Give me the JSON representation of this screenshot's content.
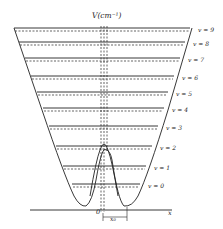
{
  "diagram": {
    "y_axis_label": "V(cm⁻¹)",
    "x_axis_label": "x",
    "origin_label": "0",
    "displacement_label": "x₀",
    "levels": [
      {
        "label": "v = 0",
        "y": 186,
        "x1": 72,
        "x2": 140
      },
      {
        "label": "v = 1",
        "y": 168,
        "x1": 63,
        "x2": 146
      },
      {
        "label": "v = 2",
        "y": 148,
        "x1": 56,
        "x2": 152
      },
      {
        "label": "v = 3",
        "y": 128,
        "x1": 49,
        "x2": 158
      },
      {
        "label": "v = 4",
        "y": 110,
        "x1": 43,
        "x2": 164
      },
      {
        "label": "v = 5",
        "y": 94,
        "x1": 37,
        "x2": 168
      },
      {
        "label": "v = 6",
        "y": 78,
        "x1": 31,
        "x2": 174
      },
      {
        "label": "v = 7",
        "y": 60,
        "x1": 25,
        "x2": 180
      },
      {
        "label": "v = 8",
        "y": 44,
        "x1": 19,
        "x2": 185
      },
      {
        "label": "v = 9",
        "y": 30,
        "x1": 14,
        "x2": 190
      }
    ],
    "colors": {
      "line": "#222222",
      "background": "#ffffff"
    }
  }
}
